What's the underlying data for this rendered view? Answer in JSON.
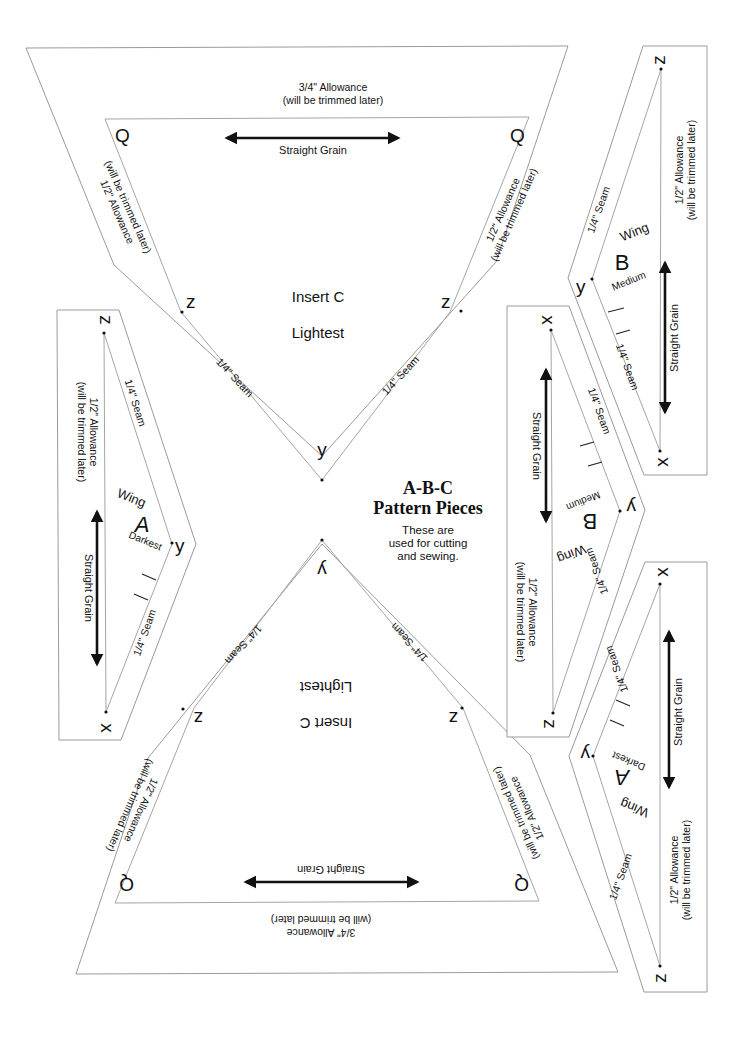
{
  "title": {
    "line1": "A-B-C",
    "line2": "Pattern Pieces",
    "sub1": "These are",
    "sub2": "used for cutting",
    "sub3": "and sewing."
  },
  "labels": {
    "allowance_34": "3/4\" Allowance",
    "allowance_12": "1/2\" Allowance",
    "trimmed": "(will be trimmed later)",
    "straight_grain": "Straight Grain",
    "seam_14": "1/4\" Seam"
  },
  "insert_c": {
    "name": "Insert  C",
    "shade": "Lightest",
    "corner_q": "Q",
    "point_z": "z",
    "point_y": "y"
  },
  "wing_a": {
    "word": "Wing",
    "letter": "A",
    "shade": "Darkest",
    "point_z": "z",
    "point_y": "y",
    "point_x": "x"
  },
  "wing_b": {
    "word": "Wing",
    "letter": "B",
    "shade": "Medium",
    "point_z": "z",
    "point_y": "y",
    "point_x": "x"
  },
  "colors": {
    "background": "#ffffff",
    "outline": "#9a9a9a",
    "ink": "#111111"
  }
}
